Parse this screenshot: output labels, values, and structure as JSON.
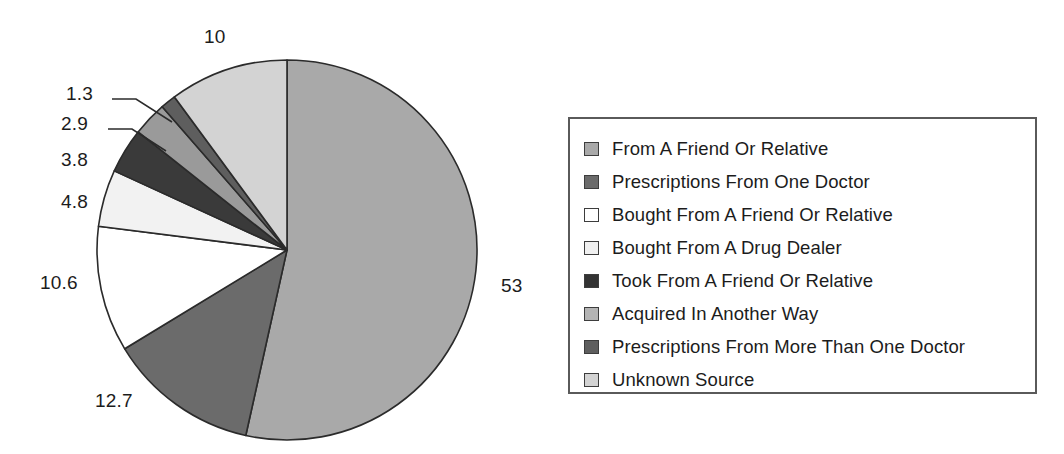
{
  "chart_data": {
    "type": "pie",
    "title": "",
    "subtitle": "",
    "xlabel": "",
    "ylabel": "",
    "legend_position": "right",
    "grid": false,
    "start_angle_deg": 0,
    "direction": "clockwise",
    "categories": [
      "From A Friend Or Relative",
      "Prescriptions From One Doctor",
      "Bought From A Friend Or Relative",
      "Bought From A Drug Dealer",
      "Took From A Friend Or Relative",
      "Acquired In Another Way",
      "Prescriptions From More Than One Doctor",
      "Unknown Source"
    ],
    "values": [
      53,
      12.7,
      10.6,
      4.8,
      3.8,
      2.9,
      1.3,
      10
    ],
    "value_labels": [
      "53",
      "12.7",
      "10.6",
      "4.8",
      "3.8",
      "2.9",
      "1.3",
      "10"
    ],
    "colors": [
      "#a9a9a9",
      "#6b6b6b",
      "#ffffff",
      "#f2f2f2",
      "#3a3a3a",
      "#9a9a9a",
      "#5e5e5e",
      "#d3d3d3"
    ],
    "slice_outline_color": "#2b2b2b"
  },
  "pie": {
    "center_x": 287,
    "center_y": 250,
    "radius": 190,
    "slices": [
      {
        "name": "From A Friend Or Relative",
        "value": 53,
        "label": "53",
        "color": "#a9a9a9"
      },
      {
        "name": "Prescriptions From One Doctor",
        "value": 12.7,
        "label": "12.7",
        "color": "#6b6b6b"
      },
      {
        "name": "Bought From A Friend Or Relative",
        "value": 10.6,
        "label": "10.6",
        "color": "#ffffff"
      },
      {
        "name": "Bought From A Drug Dealer",
        "value": 4.8,
        "label": "4.8",
        "color": "#f2f2f2"
      },
      {
        "name": "Took From A Friend Or Relative",
        "value": 3.8,
        "label": "3.8",
        "color": "#3a3a3a"
      },
      {
        "name": "Acquired In Another Way",
        "value": 2.9,
        "label": "2.9",
        "color": "#9a9a9a"
      },
      {
        "name": "Prescriptions From More Than One Doctor",
        "value": 1.3,
        "label": "1.3",
        "color": "#5e5e5e"
      },
      {
        "name": "Unknown Source",
        "value": 10,
        "label": "10",
        "color": "#d3d3d3"
      }
    ]
  },
  "data_labels": [
    {
      "id": "label-10",
      "text": "10",
      "x": 204,
      "y": 26,
      "leader": false
    },
    {
      "id": "label-1-3",
      "text": "1.3",
      "x": 66,
      "y": 83,
      "leader": true,
      "leader_path": "M 112 99 L 136 99 L 172 122"
    },
    {
      "id": "label-2-9",
      "text": "2.9",
      "x": 61,
      "y": 113,
      "leader": true,
      "leader_path": "M 108 129 L 132 129 L 166 151"
    },
    {
      "id": "label-3-8",
      "text": "3.8",
      "x": 61,
      "y": 149,
      "leader": false
    },
    {
      "id": "label-4-8",
      "text": "4.8",
      "x": 61,
      "y": 191,
      "leader": false
    },
    {
      "id": "label-10-6",
      "text": "10.6",
      "x": 40,
      "y": 272,
      "leader": false
    },
    {
      "id": "label-12-7",
      "text": "12.7",
      "x": 95,
      "y": 390,
      "leader": false
    },
    {
      "id": "label-53",
      "text": "53",
      "x": 501,
      "y": 275,
      "leader": false
    }
  ],
  "legend": {
    "items": [
      {
        "label": "From A Friend Or Relative",
        "color": "#a9a9a9"
      },
      {
        "label": "Prescriptions From One Doctor",
        "color": "#6b6b6b"
      },
      {
        "label": "Bought From A Friend Or Relative",
        "color": "#ffffff"
      },
      {
        "label": "Bought From A Drug Dealer",
        "color": "#f0f0f0"
      },
      {
        "label": "Took From A Friend Or Relative",
        "color": "#333333"
      },
      {
        "label": "Acquired In Another Way",
        "color": "#b4b4b4"
      },
      {
        "label": "Prescriptions From More Than One Doctor",
        "color": "#5e5e5e"
      },
      {
        "label": "Unknown Source",
        "color": "#d3d3d3"
      }
    ]
  }
}
